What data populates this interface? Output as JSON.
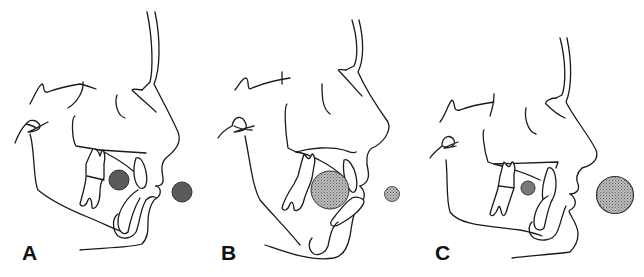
{
  "figure": {
    "panels": [
      {
        "label": "A",
        "intraoral_circle": {
          "size": "medium",
          "shade": "dark",
          "color": "#5a5a5a"
        },
        "extraoral_circle": {
          "size": "medium",
          "shade": "dark",
          "color": "#5a5a5a"
        }
      },
      {
        "label": "B",
        "intraoral_circle": {
          "size": "large",
          "shade": "stippled-light",
          "color": "#9a9a9a"
        },
        "extraoral_circle": {
          "size": "small",
          "shade": "stippled-light",
          "color": "#9a9a9a"
        }
      },
      {
        "label": "C",
        "intraoral_circle": {
          "size": "small",
          "shade": "medium",
          "color": "#7a7a7a"
        },
        "extraoral_circle": {
          "size": "large",
          "shade": "medium-dark",
          "color": "#6a6a6a"
        }
      }
    ],
    "line_color": "#1a1a1a",
    "background": "#ffffff"
  }
}
